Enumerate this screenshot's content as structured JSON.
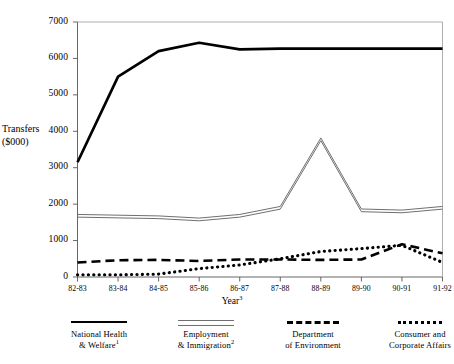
{
  "chart_data": {
    "type": "line",
    "title": "",
    "xlabel": "Year",
    "xlabel_superscript": "3",
    "ylabel_line1": "Transfers",
    "ylabel_line2": "($000)",
    "ylim": [
      0,
      7000
    ],
    "ytick_values": [
      0,
      1000,
      2000,
      3000,
      4000,
      5000,
      6000,
      7000
    ],
    "ytick_labels": [
      "0",
      "1000",
      "2000",
      "3000",
      "4000",
      "5000",
      "6000",
      "7000"
    ],
    "grid": false,
    "legend_position": "below-axes",
    "categories": [
      "82-83",
      "83-84",
      "84-85",
      "85-86",
      "86-87",
      "87-88",
      "88-89",
      "89-90",
      "90-91",
      "91-92"
    ],
    "series": [
      {
        "name": "National Health & Welfare",
        "name_line1": "National Health",
        "name_line2": "& Welfare",
        "superscript": "1",
        "style": "solid-thick",
        "color": "#000000",
        "values": [
          3150,
          5500,
          6200,
          6430,
          6250,
          6270,
          6270,
          6270,
          6270,
          6270
        ]
      },
      {
        "name": "Employment & Immigration",
        "name_line1": "Employment",
        "name_line2": "& Immigration",
        "superscript": "2",
        "style": "double-line",
        "color": "#6f6f6f",
        "values": [
          1680,
          1660,
          1640,
          1580,
          1680,
          1900,
          3780,
          1830,
          1800,
          1900
        ]
      },
      {
        "name": "Department of Environment",
        "name_line1": "Department",
        "name_line2": "of Environment",
        "superscript": "",
        "style": "dashed",
        "color": "#000000",
        "values": [
          400,
          460,
          470,
          440,
          480,
          480,
          470,
          480,
          900,
          650
        ]
      },
      {
        "name": "Consumer and Corporate Affairs",
        "name_line1": "Consumer and",
        "name_line2": "Corporate Affairs",
        "superscript": "",
        "style": "dotted",
        "color": "#000000",
        "values": [
          60,
          60,
          80,
          230,
          330,
          500,
          700,
          780,
          870,
          400
        ]
      }
    ]
  }
}
